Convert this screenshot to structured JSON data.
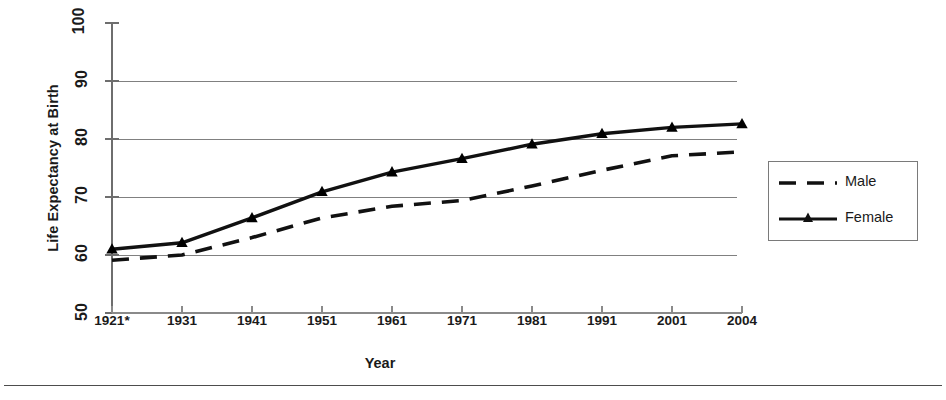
{
  "chart_data": {
    "type": "line",
    "title": "",
    "xlabel": "Year",
    "ylabel": "Life Expectancy at Birth",
    "categories": [
      "1921*",
      "1931",
      "1941",
      "1951",
      "1961",
      "1971",
      "1981",
      "1991",
      "2001",
      "2004"
    ],
    "ylim": [
      50,
      100
    ],
    "ytick_labels": [
      "50",
      "60",
      "70",
      "80",
      "90",
      "100"
    ],
    "yticks": [
      50,
      60,
      70,
      80,
      90,
      100
    ],
    "grid": "horizontal-only",
    "gridlines": [
      60,
      70,
      80,
      90
    ],
    "legend_position": "right-outside",
    "series": [
      {
        "name": "Male",
        "style": "dashed",
        "marker": "none",
        "color": "#000000",
        "values": [
          59.1,
          60.0,
          63.0,
          66.4,
          68.4,
          69.4,
          71.9,
          74.6,
          77.1,
          77.8
        ]
      },
      {
        "name": "Female",
        "style": "solid",
        "marker": "triangle",
        "color": "#000000",
        "values": [
          61.0,
          62.1,
          66.4,
          70.9,
          74.3,
          76.6,
          79.1,
          80.9,
          82.0,
          82.6
        ]
      }
    ]
  },
  "axis": {
    "y_title": "Life Expectancy at Birth",
    "x_title": "Year"
  },
  "legend": {
    "items": [
      {
        "label": "Male"
      },
      {
        "label": "Female"
      }
    ]
  }
}
